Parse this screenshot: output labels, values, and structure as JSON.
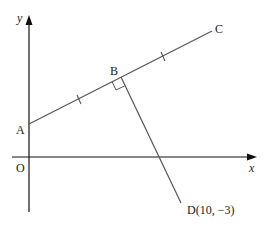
{
  "figure": {
    "axes": {
      "x_label": "x",
      "y_label": "y",
      "origin_label": "O"
    },
    "points": {
      "A": {
        "label": "A"
      },
      "B": {
        "label": "B"
      },
      "C": {
        "label": "C"
      },
      "D": {
        "label": "D(10, −3)"
      }
    },
    "marks": {
      "right_angle_at": "B",
      "equal_tick_marks": [
        "AB",
        "BC"
      ]
    },
    "colors": {
      "axis": "#111111",
      "line": "#555555"
    }
  }
}
